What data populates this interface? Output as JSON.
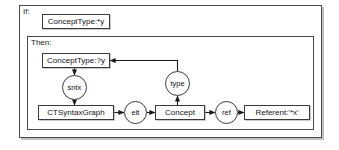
{
  "diagram": {
    "title_frames": {
      "if_label": "If:",
      "then_label": "Then:"
    },
    "nodes": {
      "if_concepttype": "ConceptType:*y",
      "then_concepttype": "ConceptType:?y",
      "ctsyntaxgraph": "CTSyntaxGraph",
      "concept": "Concept",
      "referent": "Referent:'*x'",
      "sntx": "sntx",
      "type": "type",
      "elt": "elt",
      "ref": "ref"
    },
    "colors": {
      "frame_border": "#4a4a4a",
      "node_border": "#3a3a3a",
      "edge": "#1a1a1a",
      "background": "#ffffff",
      "text": "#111111"
    },
    "edges": [
      {
        "from": "then_concepttype",
        "to": "sntx",
        "direction": "down"
      },
      {
        "from": "sntx",
        "to": "ctsyntaxgraph",
        "direction": "down"
      },
      {
        "from": "ctsyntaxgraph",
        "to": "elt",
        "direction": "right"
      },
      {
        "from": "elt",
        "to": "concept",
        "direction": "right"
      },
      {
        "from": "concept",
        "to": "type",
        "direction": "up"
      },
      {
        "from": "type",
        "to": "then_concepttype",
        "direction": "up-left"
      },
      {
        "from": "concept",
        "to": "ref",
        "direction": "right"
      },
      {
        "from": "ref",
        "to": "referent",
        "direction": "right"
      }
    ]
  }
}
